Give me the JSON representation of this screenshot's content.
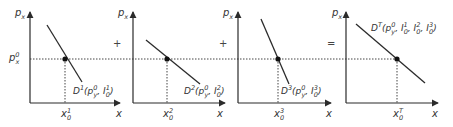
{
  "figure": {
    "colors": {
      "line": "#2b2b2b",
      "axis": "#2b2b2b",
      "dotted": "#444444",
      "text": "#333333"
    },
    "operators": [
      "+",
      "+",
      "="
    ],
    "price_label_left": {
      "base": "p",
      "sub": "x",
      "sup": "0"
    },
    "panels": [
      {
        "id": "panel-1",
        "y_axis_label": {
          "base": "p",
          "sub": "x"
        },
        "x_axis_label": "x",
        "quantity_label": {
          "base": "x",
          "sub": "0",
          "sup": "1"
        },
        "curve_label": {
          "base": "D",
          "sup": "1",
          "args": "(p",
          "args_sup": "0",
          "args_sub": "y",
          "rest": ", I",
          "rest_sub": "0",
          "rest_sup": "1",
          "close": ")"
        }
      },
      {
        "id": "panel-2",
        "y_axis_label": {
          "base": "p",
          "sub": "x"
        },
        "x_axis_label": "x",
        "quantity_label": {
          "base": "x",
          "sub": "0",
          "sup": "2"
        },
        "curve_label": {
          "base": "D",
          "sup": "2",
          "args": "(p",
          "args_sup": "0",
          "args_sub": "y",
          "rest": ", I",
          "rest_sub": "0",
          "rest_sup": "2",
          "close": ")"
        }
      },
      {
        "id": "panel-3",
        "y_axis_label": {
          "base": "p",
          "sub": "x"
        },
        "x_axis_label": "x",
        "quantity_label": {
          "base": "x",
          "sub": "0",
          "sup": "3"
        },
        "curve_label": {
          "base": "D",
          "sup": "3",
          "args": "(p",
          "args_sup": "0",
          "args_sub": "y",
          "rest": ", I",
          "rest_sub": "0",
          "rest_sup": "3",
          "close": ")"
        }
      },
      {
        "id": "panel-total",
        "y_axis_label": {
          "base": "p",
          "sub": "x"
        },
        "x_axis_label": "x",
        "quantity_label": {
          "base": "x",
          "sub": "0",
          "sup": "T"
        },
        "curve_label": {
          "base": "D",
          "sup": "T",
          "args": "(p",
          "args_sup": "0",
          "args_sub": "y",
          "rest": ", I",
          "rest_sub": "0",
          "rest_sup": "1",
          "rest2": ", I",
          "rest2_sub": "0",
          "rest2_sup": "2",
          "rest3": ", I",
          "rest3_sub": "0",
          "rest3_sup": "3",
          "close": ")"
        }
      }
    ]
  }
}
